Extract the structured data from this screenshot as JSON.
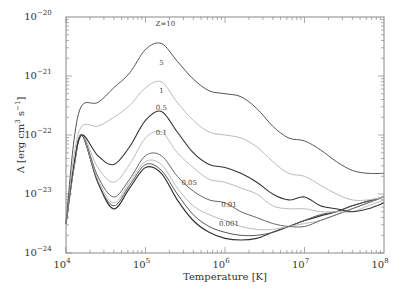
{
  "chart_data": {
    "type": "line",
    "title": "",
    "xlabel": "Temperature [K]",
    "ylabel": "Λ [erg cm^3 s^-1]",
    "xscale": "log",
    "yscale": "log",
    "xlim": [
      10000,
      100000000
    ],
    "ylim": [
      1e-24,
      1e-20
    ],
    "grid": false,
    "legend": "inline curve labels",
    "x_ticks": [
      {
        "base": "10",
        "exp": "4",
        "log": 4
      },
      {
        "base": "10",
        "exp": "5",
        "log": 5
      },
      {
        "base": "10",
        "exp": "6",
        "log": 6
      },
      {
        "base": "10",
        "exp": "7",
        "log": 7
      },
      {
        "base": "10",
        "exp": "8",
        "log": 8
      }
    ],
    "y_ticks": [
      {
        "base": "10",
        "exp": "−20",
        "log": -20
      },
      {
        "base": "10",
        "exp": "−21",
        "log": -21
      },
      {
        "base": "10",
        "exp": "−22",
        "log": -22
      },
      {
        "base": "10",
        "exp": "−23",
        "log": -23
      },
      {
        "base": "10",
        "exp": "−24",
        "log": -24
      }
    ],
    "x_log": [
      4.0,
      4.1,
      4.2,
      4.4,
      4.6,
      4.8,
      5.0,
      5.2,
      5.4,
      5.6,
      5.8,
      6.0,
      6.2,
      6.4,
      6.6,
      6.8,
      7.0,
      7.2,
      7.4,
      7.6,
      7.8,
      8.0
    ],
    "series": [
      {
        "name": "Z=10",
        "label": "Z=10",
        "color": "#555555",
        "width": 1.0,
        "label_pos": [
          5.25,
          -20.15
        ],
        "log_values": [
          -23.5,
          -22.1,
          -21.5,
          -21.45,
          -21.2,
          -20.95,
          -20.55,
          -20.45,
          -20.75,
          -21.05,
          -21.25,
          -21.3,
          -21.35,
          -21.55,
          -21.85,
          -22.05,
          -22.1,
          -22.25,
          -22.45,
          -22.6,
          -22.65,
          -22.65
        ]
      },
      {
        "name": "5",
        "label": "5",
        "color": "#bbbbbb",
        "width": 1.0,
        "label_pos": [
          5.2,
          -20.82
        ],
        "log_values": [
          -23.5,
          -22.35,
          -21.85,
          -21.85,
          -21.7,
          -21.5,
          -21.2,
          -21.1,
          -21.45,
          -21.75,
          -21.95,
          -22.0,
          -22.05,
          -22.2,
          -22.45,
          -22.65,
          -22.7,
          -22.85,
          -23.0,
          -23.1,
          -23.1,
          -23.05
        ]
      },
      {
        "name": "1",
        "label": "1",
        "color": "#333333",
        "width": 1.1,
        "label_pos": [
          5.2,
          -21.28
        ],
        "log_values": [
          -23.5,
          -22.5,
          -22.0,
          -22.35,
          -22.5,
          -22.2,
          -21.75,
          -21.6,
          -21.95,
          -22.3,
          -22.5,
          -22.55,
          -22.65,
          -22.8,
          -23.0,
          -23.1,
          -23.05,
          -23.2,
          -23.25,
          -23.3,
          -23.25,
          -23.15
        ]
      },
      {
        "name": "0.5",
        "label": "0.5",
        "color": "#bbbbbb",
        "width": 1.0,
        "label_pos": [
          5.2,
          -21.57
        ],
        "log_values": [
          -23.5,
          -22.55,
          -22.0,
          -22.55,
          -22.8,
          -22.5,
          -22.05,
          -21.95,
          -22.3,
          -22.55,
          -22.75,
          -22.8,
          -22.9,
          -23.0,
          -23.2,
          -23.25,
          -23.25,
          -23.3,
          -23.3,
          -23.3,
          -23.2,
          -23.1
        ]
      },
      {
        "name": "0.1",
        "label": "0.1",
        "color": "#666666",
        "width": 1.0,
        "label_pos": [
          5.2,
          -22.0
        ],
        "log_values": [
          -23.5,
          -22.55,
          -22.0,
          -22.7,
          -23.05,
          -22.75,
          -22.35,
          -22.35,
          -22.7,
          -22.95,
          -23.1,
          -23.15,
          -23.3,
          -23.4,
          -23.5,
          -23.55,
          -23.55,
          -23.45,
          -23.35,
          -23.25,
          -23.15,
          -23.05
        ]
      },
      {
        "name": "0.05",
        "label": "0.05",
        "color": "#bbbbbb",
        "width": 1.0,
        "label_pos": [
          5.55,
          -22.85
        ],
        "log_values": [
          -23.5,
          -22.55,
          -22.0,
          -22.75,
          -23.15,
          -22.8,
          -22.45,
          -22.5,
          -22.9,
          -23.2,
          -23.35,
          -23.45,
          -23.55,
          -23.6,
          -23.6,
          -23.55,
          -23.5,
          -23.45,
          -23.35,
          -23.25,
          -23.15,
          -23.05
        ]
      },
      {
        "name": "0.01",
        "label": "0.01",
        "color": "#555555",
        "width": 1.0,
        "label_pos": [
          6.05,
          -23.22
        ],
        "log_values": [
          -23.5,
          -22.55,
          -22.0,
          -22.8,
          -23.2,
          -22.85,
          -22.5,
          -22.6,
          -23.0,
          -23.35,
          -23.55,
          -23.65,
          -23.7,
          -23.7,
          -23.65,
          -23.55,
          -23.45,
          -23.35,
          -23.3,
          -23.2,
          -23.12,
          -23.05
        ]
      },
      {
        "name": "0.001",
        "label": "0.001",
        "color": "#333333",
        "width": 1.2,
        "label_pos": [
          6.05,
          -23.55
        ],
        "log_values": [
          -23.5,
          -22.55,
          -22.0,
          -22.8,
          -23.25,
          -22.9,
          -22.55,
          -22.65,
          -23.1,
          -23.45,
          -23.65,
          -23.75,
          -23.78,
          -23.75,
          -23.65,
          -23.55,
          -23.45,
          -23.37,
          -23.3,
          -23.2,
          -23.12,
          -23.05
        ]
      }
    ]
  },
  "axes": {
    "xlabel": "Temperature [K]",
    "ylabel_prefix": "Λ [erg cm",
    "ylabel_exp1": "3",
    "ylabel_mid": " s",
    "ylabel_exp2": "−1",
    "ylabel_suffix": "]"
  }
}
